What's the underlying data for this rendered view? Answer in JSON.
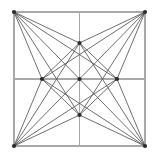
{
  "figure": {
    "type": "line-diagram",
    "background_color": "#ffffff",
    "canvas": {
      "width": 157,
      "height": 158
    },
    "square": {
      "left": 14,
      "top": 12,
      "right": 145,
      "bottom": 146,
      "stroke_color": "#a8a8a8",
      "stroke_width": 1.1
    },
    "chord_stroke_color": "#555555",
    "chord_stroke_width": 0.85,
    "node_color": "#2b2b2b",
    "node_radius": 2.1,
    "points": {
      "corner_top_left": {
        "name": "corner-top-left",
        "x": 14,
        "y": 12
      },
      "corner_top_right": {
        "name": "corner-top-right",
        "x": 145,
        "y": 12
      },
      "corner_bottom_right": {
        "name": "corner-bottom-right",
        "x": 145,
        "y": 146
      },
      "corner_bottom_left": {
        "name": "corner-bottom-left",
        "x": 14,
        "y": 146
      },
      "mid_top": {
        "name": "midpoint-top",
        "x": 79.5,
        "y": 43
      },
      "mid_right": {
        "name": "midpoint-right",
        "x": 117,
        "y": 79
      },
      "mid_bottom": {
        "name": "midpoint-bottom",
        "x": 79.5,
        "y": 115
      },
      "mid_left": {
        "name": "midpoint-left",
        "x": 42,
        "y": 79
      },
      "center": {
        "name": "center",
        "x": 79.5,
        "y": 79
      }
    },
    "grid_lines": [
      {
        "name": "square-top-edge",
        "x1": 14,
        "y1": 12,
        "x2": 145,
        "y2": 12
      },
      {
        "name": "square-right-edge",
        "x1": 145,
        "y1": 12,
        "x2": 145,
        "y2": 146
      },
      {
        "name": "square-bottom-edge",
        "x1": 145,
        "y1": 146,
        "x2": 14,
        "y2": 146
      },
      {
        "name": "square-left-edge",
        "x1": 14,
        "y1": 146,
        "x2": 14,
        "y2": 12
      },
      {
        "name": "vertical-midline",
        "x1": 79.5,
        "y1": 12,
        "x2": 79.5,
        "y2": 146
      },
      {
        "name": "horizontal-midline",
        "x1": 14,
        "y1": 79,
        "x2": 145,
        "y2": 79
      }
    ],
    "chords": [
      {
        "name": "chord-tl-to-midtop",
        "x1": 14,
        "y1": 12,
        "x2": 79.5,
        "y2": 43
      },
      {
        "name": "chord-tl-to-midright",
        "x1": 14,
        "y1": 12,
        "x2": 117,
        "y2": 79
      },
      {
        "name": "chord-tl-to-center",
        "x1": 14,
        "y1": 12,
        "x2": 79.5,
        "y2": 79
      },
      {
        "name": "chord-tl-to-midbottom",
        "x1": 14,
        "y1": 12,
        "x2": 79.5,
        "y2": 115
      },
      {
        "name": "chord-tl-to-midleft",
        "x1": 14,
        "y1": 12,
        "x2": 42,
        "y2": 79
      },
      {
        "name": "chord-tr-to-midtop",
        "x1": 145,
        "y1": 12,
        "x2": 79.5,
        "y2": 43
      },
      {
        "name": "chord-tr-to-midleft",
        "x1": 145,
        "y1": 12,
        "x2": 42,
        "y2": 79
      },
      {
        "name": "chord-tr-to-center",
        "x1": 145,
        "y1": 12,
        "x2": 79.5,
        "y2": 79
      },
      {
        "name": "chord-tr-to-midbottom",
        "x1": 145,
        "y1": 12,
        "x2": 79.5,
        "y2": 115
      },
      {
        "name": "chord-tr-to-midright",
        "x1": 145,
        "y1": 12,
        "x2": 117,
        "y2": 79
      },
      {
        "name": "chord-bl-to-midbottom",
        "x1": 14,
        "y1": 146,
        "x2": 79.5,
        "y2": 115
      },
      {
        "name": "chord-bl-to-midright",
        "x1": 14,
        "y1": 146,
        "x2": 117,
        "y2": 79
      },
      {
        "name": "chord-bl-to-center",
        "x1": 14,
        "y1": 146,
        "x2": 79.5,
        "y2": 79
      },
      {
        "name": "chord-bl-to-midtop",
        "x1": 14,
        "y1": 146,
        "x2": 79.5,
        "y2": 43
      },
      {
        "name": "chord-bl-to-midleft",
        "x1": 14,
        "y1": 146,
        "x2": 42,
        "y2": 79
      },
      {
        "name": "chord-br-to-midbottom",
        "x1": 145,
        "y1": 146,
        "x2": 79.5,
        "y2": 115
      },
      {
        "name": "chord-br-to-midleft",
        "x1": 145,
        "y1": 146,
        "x2": 42,
        "y2": 79
      },
      {
        "name": "chord-br-to-center",
        "x1": 145,
        "y1": 146,
        "x2": 79.5,
        "y2": 79
      },
      {
        "name": "chord-br-to-midtop",
        "x1": 145,
        "y1": 146,
        "x2": 79.5,
        "y2": 43
      },
      {
        "name": "chord-br-to-midright",
        "x1": 145,
        "y1": 146,
        "x2": 117,
        "y2": 79
      },
      {
        "name": "chord-midtop-to-midleft",
        "x1": 79.5,
        "y1": 43,
        "x2": 42,
        "y2": 79
      },
      {
        "name": "chord-midtop-to-midright",
        "x1": 79.5,
        "y1": 43,
        "x2": 117,
        "y2": 79
      },
      {
        "name": "chord-midbottom-to-midleft",
        "x1": 79.5,
        "y1": 115,
        "x2": 42,
        "y2": 79
      },
      {
        "name": "chord-midbottom-to-midright",
        "x1": 79.5,
        "y1": 115,
        "x2": 117,
        "y2": 79
      }
    ],
    "nodes": [
      {
        "name": "node-corner-top-left",
        "x": 14,
        "y": 12
      },
      {
        "name": "node-corner-top-right",
        "x": 145,
        "y": 12
      },
      {
        "name": "node-corner-bottom-right",
        "x": 145,
        "y": 146
      },
      {
        "name": "node-corner-bottom-left",
        "x": 14,
        "y": 146
      },
      {
        "name": "node-midpoint-top",
        "x": 79.5,
        "y": 43
      },
      {
        "name": "node-midpoint-right",
        "x": 117,
        "y": 79
      },
      {
        "name": "node-midpoint-bottom",
        "x": 79.5,
        "y": 115
      },
      {
        "name": "node-midpoint-left",
        "x": 42,
        "y": 79
      },
      {
        "name": "node-center",
        "x": 79.5,
        "y": 79
      }
    ]
  }
}
